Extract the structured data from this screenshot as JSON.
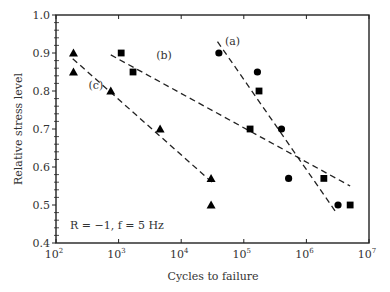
{
  "chart_data": {
    "type": "scatter",
    "title": "",
    "xlabel": "Cycles to failure",
    "ylabel": "Relative stress level",
    "xscale": "log",
    "xlim": [
      100,
      10000000
    ],
    "ylim": [
      0.4,
      1.0
    ],
    "x_ticks": [
      {
        "value": 100,
        "base": "10",
        "exp": "2"
      },
      {
        "value": 1000,
        "base": "10",
        "exp": "3"
      },
      {
        "value": 10000,
        "base": "10",
        "exp": "4"
      },
      {
        "value": 100000,
        "base": "10",
        "exp": "5"
      },
      {
        "value": 1000000,
        "base": "10",
        "exp": "6"
      },
      {
        "value": 10000000,
        "base": "10",
        "exp": "7"
      }
    ],
    "y_ticks": [
      "0.4",
      "0.5",
      "0.6",
      "0.7",
      "0.8",
      "0.9",
      "1.0"
    ],
    "grid": false,
    "annotation": "R = −1, f = 5 Hz",
    "series": [
      {
        "name": "(a)",
        "marker": "circle",
        "points": [
          {
            "x": 40000,
            "y": 0.9
          },
          {
            "x": 165000,
            "y": 0.85
          },
          {
            "x": 400000,
            "y": 0.7
          },
          {
            "x": 520000,
            "y": 0.57
          },
          {
            "x": 3200000,
            "y": 0.5
          }
        ],
        "fit_line": [
          {
            "x": 38000,
            "y": 0.93
          },
          {
            "x": 3000000,
            "y": 0.48
          }
        ],
        "label_pos": {
          "x": 50000,
          "y": 0.92
        }
      },
      {
        "name": "(b)",
        "marker": "square",
        "points": [
          {
            "x": 1100,
            "y": 0.9
          },
          {
            "x": 1700,
            "y": 0.85
          },
          {
            "x": 175000,
            "y": 0.8
          },
          {
            "x": 126000,
            "y": 0.7
          },
          {
            "x": 1900000,
            "y": 0.57
          },
          {
            "x": 5000000,
            "y": 0.5
          }
        ],
        "fit_line": [
          {
            "x": 750,
            "y": 0.895
          },
          {
            "x": 5000000,
            "y": 0.55
          }
        ],
        "label_pos": {
          "x": 4000,
          "y": 0.885
        }
      },
      {
        "name": "(c)",
        "marker": "triangle",
        "points": [
          {
            "x": 190,
            "y": 0.9
          },
          {
            "x": 190,
            "y": 0.85
          },
          {
            "x": 750,
            "y": 0.8
          },
          {
            "x": 4600,
            "y": 0.7
          },
          {
            "x": 30000,
            "y": 0.57
          },
          {
            "x": 30000,
            "y": 0.5
          }
        ],
        "fit_line": [
          {
            "x": 185,
            "y": 0.885
          },
          {
            "x": 31000,
            "y": 0.56
          }
        ],
        "label_pos": {
          "x": 330,
          "y": 0.805
        }
      }
    ]
  }
}
